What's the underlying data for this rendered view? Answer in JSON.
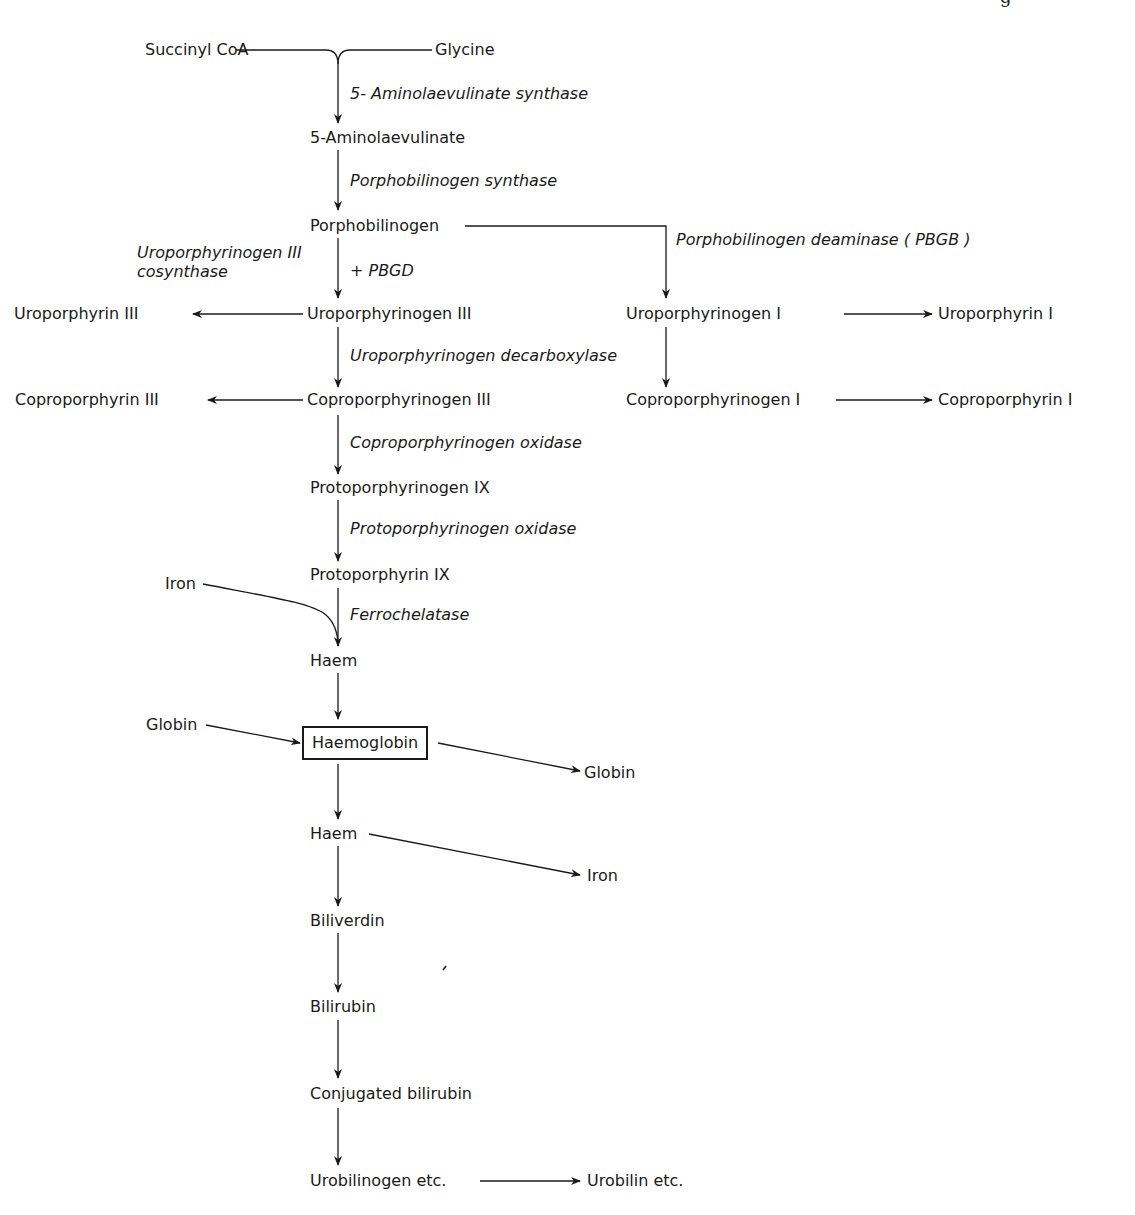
{
  "header": {
    "fragment": "g"
  },
  "nodes": {
    "succinyl_coa": "Succinyl CoA",
    "glycine": "Glycine",
    "aminolaevulinate": "5-Aminolaevulinate",
    "porphobilinogen": "Porphobilinogen",
    "uroporphyrin_iii": "Uroporphyrin III",
    "uroporphyrinogen_iii": "Uroporphyrinogen III",
    "uroporphyrinogen_i": "Uroporphyrinogen I",
    "uroporphyrin_i": "Uroporphyrin I",
    "coproporphyrin_iii": "Coproporphyrin III",
    "coproporphyrinogen_iii": "Coproporphyrinogen III",
    "coproporphyrinogen_i": "Coproporphyrinogen I",
    "coproporphyrin_i": "Coproporphyrin I",
    "protoporphyrinogen_ix": "Protoporphyrinogen IX",
    "protoporphyrin_ix": "Protoporphyrin IX",
    "iron_in": "Iron",
    "haem_1": "Haem",
    "globin_in": "Globin",
    "haemoglobin": "Haemoglobin",
    "globin_out": "Globin",
    "haem_2": "Haem",
    "iron_out": "Iron",
    "biliverdin": "Biliverdin",
    "bilirubin": "Bilirubin",
    "conjugated_bilirubin": "Conjugated bilirubin",
    "urobilinogen": "Urobilinogen etc.",
    "urobilin": "Urobilin etc."
  },
  "enzymes": {
    "ala_synthase": "5- Aminolaevulinate synthase",
    "pbg_synthase": "Porphobilinogen synthase",
    "uro_iii_cosynthase_line1": "Uroporphyrinogen III",
    "uro_iii_cosynthase_line2": "cosynthase",
    "plus_pbgd": "+ PBGD",
    "pbg_deaminase": "Porphobilinogen deaminase ( PBGB )",
    "uro_decarboxylase": "Uroporphyrinogen decarboxylase",
    "copro_oxidase": "Coproporphyrinogen oxidase",
    "proto_oxidase": "Protoporphyrinogen oxidase",
    "ferrochelatase": "Ferrochelatase"
  },
  "colors": {
    "ink": "#1a1a1a",
    "background": "#ffffff"
  }
}
